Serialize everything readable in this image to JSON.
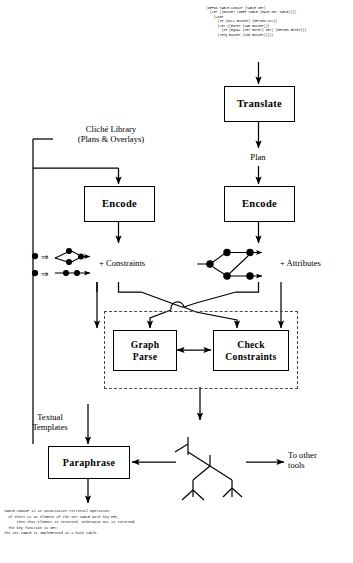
{
  "figure": {
    "domain": "diagram",
    "type": "program-understanding-pipeline-flowchart",
    "background": "#ffffff",
    "ink": "#000000",
    "dashed_region_color": "#4a4a4a"
  },
  "code_input": {
    "language": "lisp",
    "text": "(DEFUN TABLE-LOOKUP (TABLE KEY)\n  (LET ((BUCKET (AREF TABLE (HASH KEY TABLE))))\n    (LOOP\n      (IF (NULL BUCKET) (RETURN NIL))\n      (LET ((ENTRY (CAR BUCKET)))\n        (IF (EQUAL (KEY ENTRY) KEY) (RETURN ENTRY)))\n      (SETQ BUCKET (CDR BUCKET)))))"
  },
  "boxes": [
    {
      "id": "translate",
      "label": "Translate"
    },
    {
      "id": "encode_left",
      "label": "Encode"
    },
    {
      "id": "encode_right",
      "label": "Encode"
    },
    {
      "id": "graph_parse",
      "label": "Graph\nParse"
    },
    {
      "id": "check_constraints",
      "label": "Check\nConstraints"
    },
    {
      "id": "paraphrase",
      "label": "Paraphrase"
    }
  ],
  "box_labels": {
    "translate": "Translate",
    "encode_left": "Encode",
    "encode_right": "Encode",
    "graph_parse_line1": "Graph",
    "graph_parse_line2": "Parse",
    "check_constraints_line1": "Check",
    "check_constraints_line2": "Constraints",
    "paraphrase": "Paraphrase"
  },
  "labels": {
    "cliche_library_line1": "Cliché Library",
    "cliche_library_line2": "(Plans & Overlays)",
    "plan": "Plan",
    "constraints": "+ Constraints",
    "attributes": "+ Attributes",
    "textual_templates_line1": "Textual",
    "textual_templates_line2": "Templates",
    "to_other_tools_line1": "To other",
    "to_other_tools_line2": "tools"
  },
  "caption": {
    "text": "TABLE-LOOKUP is an associative retrieval operation.\n  If there is an element of the set TABLE with key KEY,\n      then that element is returned, otherwise NIL is returned.\n  The key function is KEY.\nThe set TABLE is implemented as a hash table."
  },
  "graph_glyphs": {
    "left_rules_description": "two cliché rewrite rules: node ⇒ small dataflow subgraph",
    "right_graph_description": "encoded dataflow graph of four nodes with arrows",
    "rule_arrow_glyph": "⇒",
    "tree_description": "derivation tree produced by graph parse"
  },
  "flow_edges": [
    {
      "from": "code_input",
      "to": "translate",
      "label": ""
    },
    {
      "from": "translate",
      "to": "encode_right",
      "label": "Plan"
    },
    {
      "from": "cliche_library",
      "to": "encode_left",
      "label": ""
    },
    {
      "from": "encode_left",
      "to": "constraints_graph",
      "label": "+ Constraints"
    },
    {
      "from": "encode_right",
      "to": "attributes_graph",
      "label": "+ Attributes"
    },
    {
      "from": "constraints_graph",
      "to": "check_constraints",
      "label": ""
    },
    {
      "from": "attributes_graph",
      "to": "graph_parse",
      "label": ""
    },
    {
      "from": "graph_parse",
      "to": "check_constraints",
      "label": "bidirectional"
    },
    {
      "from": "graph_parse",
      "to": "derivation_tree",
      "label": ""
    },
    {
      "from": "cliche_library",
      "to": "paraphrase",
      "label": "Textual Templates"
    },
    {
      "from": "derivation_tree",
      "to": "paraphrase",
      "label": ""
    },
    {
      "from": "derivation_tree",
      "to": "other_tools",
      "label": "To other tools"
    },
    {
      "from": "paraphrase",
      "to": "caption",
      "label": ""
    }
  ]
}
